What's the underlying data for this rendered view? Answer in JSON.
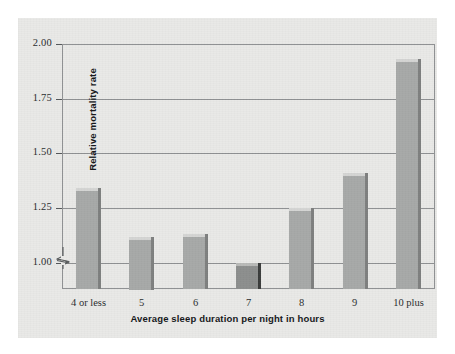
{
  "chart_data": {
    "type": "bar",
    "title": "",
    "subtitle": "",
    "xlabel": "Average sleep duration per night in hours",
    "ylabel": "Relative mortality rate",
    "categories": [
      "4 or less",
      "5",
      "6",
      "7",
      "8",
      "9",
      "10 plus"
    ],
    "values": [
      1.34,
      1.12,
      1.13,
      1.0,
      1.25,
      1.41,
      1.93
    ],
    "ylim": [
      0.88,
      2.0
    ],
    "yticks": [
      "1.00",
      "1.25",
      "1.50",
      "1.75",
      "2.00"
    ],
    "ytick_values": [
      1.0,
      1.25,
      1.5,
      1.75,
      2.0
    ],
    "grid": true,
    "legend": "none",
    "axis_break": true,
    "axis_break_note": "y-axis broken below 1.00",
    "highlight_index": 3,
    "colors": {
      "bar": "#a7a9a8",
      "bar_highlight": "#8d8f8e",
      "bar_top": "#d4d5d3",
      "bar_side": "#7e807f",
      "bar_highlight_side": "#3b3d3c",
      "background": "#e9e9e7",
      "grid": "#8f9193",
      "frame": "#8f9193",
      "text": "#15171a",
      "page": "#ffffff"
    }
  }
}
